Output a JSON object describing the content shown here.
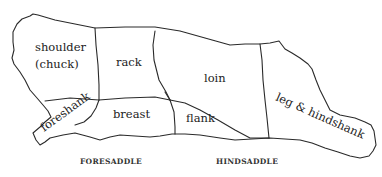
{
  "diagram": {
    "cuts": {
      "shoulder": "shoulder",
      "shoulder_alt": "(chuck)",
      "rack": "rack",
      "loin": "loin",
      "leg": "leg & hindshank",
      "foreshank": "foreshank",
      "breast": "breast",
      "flank": "flank"
    },
    "sections": {
      "fore": "FORESADDLE",
      "hind": "HINDSADDLE"
    },
    "colors": {
      "line": "#2a2a2a",
      "text": "#222222",
      "background": "#ffffff"
    }
  }
}
